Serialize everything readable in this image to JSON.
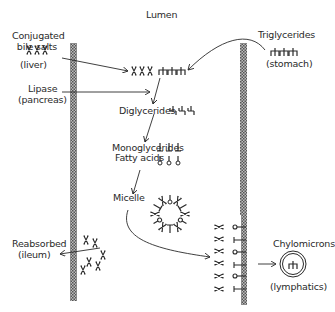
{
  "title": "Lumen",
  "labels": {
    "bile_salts": [
      "Conjugated",
      "bile salts"
    ],
    "bile_source": "(liver)",
    "lipase": "Lipase",
    "lipase_source": "(pancreas)",
    "triglycerides": "Triglycerides",
    "triglycerides_source": "(stomach)",
    "diglycerides": "Diglycerides",
    "monoglycerides": "Monoglycerides",
    "fatty_acids": "Fatty acids",
    "micelle": "Micelle",
    "reabsorbed": "Reabsorbed",
    "reabsorbed_source": "(ileum)",
    "chylomicrons": "Chylomicrons",
    "chylomicrons_dest": "(lymphatics)"
  },
  "colors": {
    "ink": "#2a2a2a",
    "wall": "#8a8a8a"
  }
}
